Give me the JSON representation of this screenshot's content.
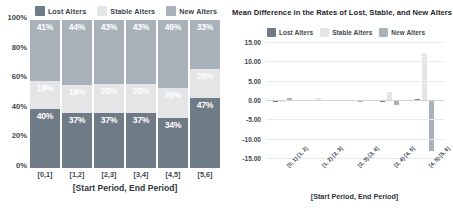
{
  "colors": {
    "lost": "#6f7b87",
    "stable": "#e3e5e7",
    "new": "#a9b2ba",
    "axis_text": "#3d4550",
    "grid": "#e9eaec",
    "background": "#ffffff"
  },
  "legend": {
    "lost_label": "Lost Alters",
    "stable_label": "Stable Alters",
    "new_label": "New Alters"
  },
  "left_chart": {
    "xtitle": "[Start Period, End Period]"
  },
  "right_chart": {
    "title": "Mean Difference in the Rates of Lost, Stable, and New Alters",
    "xtitle": "[Start Period, End Period]"
  },
  "chart_data": [
    {
      "type": "bar",
      "subtype": "stacked-percent",
      "title": "",
      "xlabel": "[Start Period, End Period]",
      "ylabel": "",
      "categories": [
        "[0,1]",
        "[1,2]",
        "[2,3]",
        "[3,4]",
        "[4,5]",
        "[5,6]"
      ],
      "ytick_labels": [
        "0%",
        "20%",
        "40%",
        "60%",
        "80%",
        "100%"
      ],
      "ylim": [
        0,
        100
      ],
      "grid": false,
      "legend_position": "top",
      "series": [
        {
          "name": "Lost Alters",
          "values": [
            40,
            37,
            37,
            37,
            34,
            47
          ],
          "labels": [
            "40%",
            "37%",
            "37%",
            "37%",
            "34%",
            "47%"
          ]
        },
        {
          "name": "Stable Alters",
          "values": [
            19,
            19,
            20,
            20,
            20,
            20
          ],
          "labels": [
            "19%",
            "19%",
            "20%",
            "20%",
            "20%",
            "20%"
          ]
        },
        {
          "name": "New Alters",
          "values": [
            41,
            44,
            43,
            43,
            46,
            33
          ],
          "labels": [
            "41%",
            "44%",
            "43%",
            "43%",
            "46%",
            "33%"
          ]
        }
      ]
    },
    {
      "type": "bar",
      "subtype": "grouped",
      "title": "Mean Difference in the Rates of Lost, Stable, and New Alters",
      "xlabel": "[Start Period, End Period]",
      "ylabel": "",
      "categories": [
        "[0, 1]-[1, 2]",
        "[1, 2]-[2, 3]",
        "[2, 3]-[3, 4]",
        "[3, 4]-[4, 5]",
        "[4, 5]-[5, 6]"
      ],
      "ytick_labels": [
        "15.00",
        "10.00",
        "5.00",
        "0.00",
        "-5.00",
        "-10.00",
        "-15.00"
      ],
      "ylim": [
        -15,
        15
      ],
      "grid": true,
      "legend_position": "top",
      "series": [
        {
          "name": "Lost Alters",
          "values": [
            -0.6,
            -0.2,
            -0.3,
            -0.6,
            0.3
          ]
        },
        {
          "name": "Stable Alters",
          "values": [
            -0.4,
            0.5,
            -0.2,
            2.1,
            12.2
          ]
        },
        {
          "name": "New Alters",
          "values": [
            0.5,
            -0.3,
            -0.4,
            -1.2,
            -13.1
          ]
        }
      ]
    }
  ]
}
